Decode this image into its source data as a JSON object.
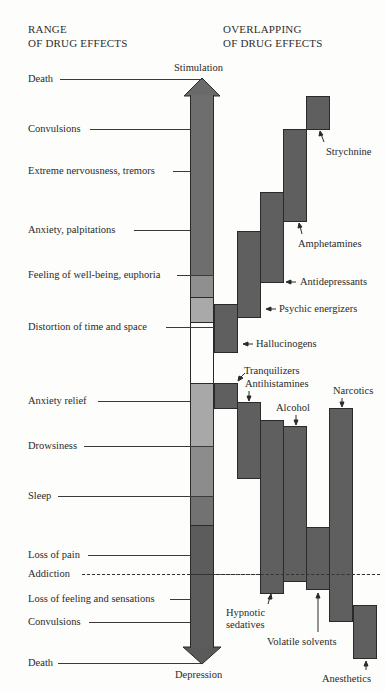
{
  "headers": {
    "left": [
      "RANGE",
      "OF DRUG EFFECTS"
    ],
    "right": [
      "OVERLAPPING",
      "OF DRUG EFFECTS"
    ]
  },
  "axis": {
    "top_label": "Stimulation",
    "bottom_label": "Depression"
  },
  "effects": [
    {
      "label": "Death",
      "y": 79
    },
    {
      "label": "Convulsions",
      "y": 129
    },
    {
      "label": "Extreme nervousness, tremors",
      "y": 171
    },
    {
      "label": "Anxiety, palpitations",
      "y": 230
    },
    {
      "label": "Feeling of well-being, euphoria",
      "y": 275
    },
    {
      "label": "Distortion of time and space",
      "y": 327
    },
    {
      "label": "Anxiety relief",
      "y": 401
    },
    {
      "label": "Drowsiness",
      "y": 446
    },
    {
      "label": "Sleep",
      "y": 496
    },
    {
      "label": "Loss of pain",
      "y": 555
    },
    {
      "label": "Addiction",
      "y": 574
    },
    {
      "label": "Loss of feeling and sensations",
      "y": 599
    },
    {
      "label": "Convulsions",
      "y": 622
    },
    {
      "label": "Death",
      "y": 663
    }
  ],
  "drugs": [
    {
      "name": "Strychnine"
    },
    {
      "name": "Amphetamines"
    },
    {
      "name": "Antidepressants"
    },
    {
      "name": "Psychic energizers"
    },
    {
      "name": "Hallucinogens"
    },
    {
      "name": "Tranquilizers"
    },
    {
      "name": "Antihistamines"
    },
    {
      "name": "Alcohol"
    },
    {
      "name": "Narcotics"
    },
    {
      "name": "Hypnotic",
      "name2": "sedatives"
    },
    {
      "name": "Volatile solvents"
    },
    {
      "name": "Anesthetics"
    }
  ],
  "colors": {
    "bar_dark": "#5f5f5f",
    "stim_upper": "#6e6e6e",
    "euphoria": "#8f8f8f",
    "distortion": "#a9a9a9",
    "anxiety_relief": "#a8a8a8",
    "drowsiness": "#8c8c8c",
    "sleep": "#727272",
    "depression_lower": "#5c5c5c",
    "background": "#fdfdfb"
  }
}
